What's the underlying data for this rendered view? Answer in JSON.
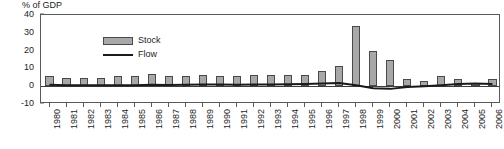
{
  "chart_data": {
    "type": "bar",
    "title": "% of GDP",
    "xlabel": "",
    "ylabel": "",
    "ylim": [
      -10,
      40
    ],
    "yticks": [
      40,
      30,
      20,
      10,
      0,
      -10
    ],
    "grid": false,
    "legend_position": "top-left-inside",
    "categories": [
      "1980",
      "1981",
      "1982",
      "1983",
      "1984",
      "1985",
      "1986",
      "1987",
      "1988",
      "1989",
      "1990",
      "1991",
      "1992",
      "1993",
      "1994",
      "1995",
      "1996",
      "1997",
      "1998",
      "1999",
      "2000",
      "2001",
      "2002",
      "2003",
      "2004",
      "2005",
      "2006"
    ],
    "series": [
      {
        "name": "Stock",
        "type": "bar",
        "color": "#a8a8a8",
        "edge_color": "#4a4a4a",
        "values": [
          5.5,
          4.5,
          4.5,
          4.5,
          5.5,
          5.5,
          7.0,
          5.5,
          6.0,
          6.5,
          6.0,
          5.5,
          6.5,
          6.5,
          6.5,
          6.5,
          8.5,
          11.5,
          34.0,
          20.0,
          15.0,
          4.0,
          3.0,
          5.5,
          4.0,
          2.0,
          4.0
        ]
      },
      {
        "name": "Flow",
        "type": "line",
        "color": "#1a1a1a",
        "values": [
          0.8,
          0.6,
          0.5,
          0.5,
          0.6,
          0.6,
          0.8,
          0.7,
          0.8,
          1.0,
          0.9,
          0.8,
          1.0,
          1.0,
          1.1,
          1.2,
          1.5,
          1.8,
          0.5,
          -1.2,
          -1.5,
          -0.5,
          0.0,
          0.5,
          1.2,
          1.5,
          1.2
        ]
      }
    ]
  },
  "legend": {
    "items": [
      {
        "label": "Stock",
        "marker": "bar-swatch"
      },
      {
        "label": "Flow",
        "marker": "line-swatch"
      }
    ]
  }
}
